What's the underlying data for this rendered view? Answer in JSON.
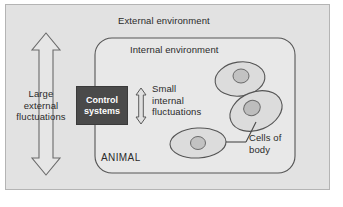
{
  "figure": {
    "background_color": "#e2e2e2",
    "panel_border_color": "#b4b4b4"
  },
  "labels": {
    "external_environment": "External environment",
    "internal_environment": "Internal environment",
    "animal": "ANIMAL",
    "large_external_fluctuations": "Large\nexternal\nfluctuations",
    "small_internal_fluctuations": "Small\ninternal\nfluctuations",
    "cells_of_body": "Cells of\nbody"
  },
  "control_systems_box": {
    "label": "Control\nsystems",
    "fill_color": "#4a4a4a",
    "text_color": "#ffffff"
  },
  "arrows": {
    "large_external": {
      "name": "large-external-fluctuations-arrow",
      "direction": "double-vertical",
      "style": "outlined"
    },
    "small_internal": {
      "name": "small-internal-fluctuations-arrow",
      "direction": "double-vertical",
      "style": "outlined"
    }
  },
  "cells": [
    {
      "name": "cell-top",
      "orientation": "upright-oval"
    },
    {
      "name": "cell-middle",
      "orientation": "tilted-oval"
    },
    {
      "name": "cell-bottom",
      "orientation": "horizontal-oval"
    }
  ],
  "colors": {
    "outline": "#555555",
    "cell_fill": "#dcdcdc",
    "nucleus_fill": "#c0c0c0",
    "inner_box_fill": "#e8e8e8",
    "text": "#2b2b2b"
  }
}
